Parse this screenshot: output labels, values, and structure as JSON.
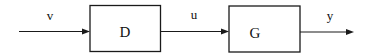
{
  "diagram": {
    "type": "block-diagram",
    "blocks": [
      {
        "id": "D",
        "label": "D"
      },
      {
        "id": "G",
        "label": "G"
      }
    ],
    "signals": [
      {
        "id": "v",
        "label": "v",
        "from": null,
        "to": "D"
      },
      {
        "id": "u",
        "label": "u",
        "from": "D",
        "to": "G"
      },
      {
        "id": "y",
        "label": "y",
        "from": "G",
        "to": null
      }
    ],
    "colors": {
      "stroke": "#1a1a1a",
      "background": "#ffffff"
    }
  }
}
